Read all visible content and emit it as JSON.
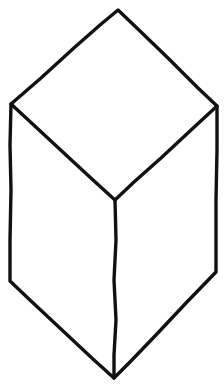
{
  "figure": {
    "kind": "line-drawing",
    "canvas": {
      "width": 224,
      "height": 388,
      "background": "#ffffff"
    },
    "stroke": {
      "color": "#111111",
      "width": 3.4,
      "style": "solid",
      "cap": "round"
    },
    "vertices": {
      "top_apex": {
        "label": "top apex",
        "x": 118,
        "y": 10
      },
      "upper_left": {
        "label": "upper left",
        "x": 11,
        "y": 104
      },
      "upper_right": {
        "label": "upper right",
        "x": 217,
        "y": 106
      },
      "center_junction": {
        "label": "center Y-junction",
        "x": 115,
        "y": 200
      },
      "lower_left": {
        "label": "lower left",
        "x": 10,
        "y": 281
      },
      "lower_right": {
        "label": "lower right",
        "x": 216,
        "y": 272
      },
      "bottom_apex": {
        "label": "bottom apex",
        "x": 114,
        "y": 378
      }
    },
    "paths": {
      "outline": "M 11 104 L 41 78 L 75 47 L 100 25 L 118 10 L 140 31 L 170 60 L 198 88 L 217 106 L 217 150 L 216 200 L 216 240 L 216 272 L 186 303 L 155 336 L 130 362 L 114 378 L 94 360 L 62 330 L 31 301 L 10 281 L 10 240 L 11 190 L 10 145 Z",
      "left_inner_diagonal": "M 11 104 L 38 129 L 66 155 L 93 180 L 115 200",
      "right_inner_diagonal": "M 217 106 L 190 131 L 161 158 L 134 182 L 115 200",
      "center_vertical": "M 115 200 L 116 240 L 114 280 L 116 320 L 114 355 L 114 378"
    },
    "faces": [
      {
        "name": "top-face",
        "points": "11,104 118,10 217,106 115,200"
      },
      {
        "name": "left-face",
        "points": "11,104 115,200 114,378 10,281"
      },
      {
        "name": "right-face",
        "points": "115,200 217,106 216,272 114,378"
      }
    ]
  }
}
